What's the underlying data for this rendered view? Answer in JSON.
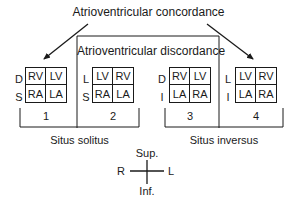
{
  "labels": {
    "concordance": "Atrioventricular concordance",
    "discordance": "Atrioventricular discordance",
    "situs_solitus": "Situs solitus",
    "situs_inversus": "Situs inversus"
  },
  "boxes": [
    {
      "number": "1",
      "top_label": "D",
      "bottom_label": "S",
      "cells": [
        "RV",
        "LV",
        "RA",
        "LA"
      ]
    },
    {
      "number": "2",
      "top_label": "L",
      "bottom_label": "S",
      "cells": [
        "LV",
        "RV",
        "RA",
        "LA"
      ]
    },
    {
      "number": "3",
      "top_label": "D",
      "bottom_label": "I",
      "cells": [
        "RV",
        "LV",
        "LA",
        "RA"
      ]
    },
    {
      "number": "4",
      "top_label": "L",
      "bottom_label": "I",
      "cells": [
        "LV",
        "RV",
        "LA",
        "RA"
      ]
    }
  ],
  "orientation": {
    "superior": "Sup.",
    "inferior": "Inf.",
    "right": "R",
    "left": "L"
  }
}
